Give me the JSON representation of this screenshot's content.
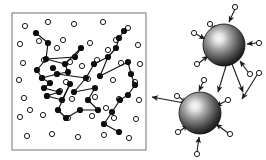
{
  "figure": {
    "background_color": "#ffffff",
    "panels": [
      {
        "id": "left-panel",
        "name": "boxed-particle-network",
        "description": "Square box containing open circles and a connected network of filled circles",
        "box": {
          "x": 12,
          "y": 13,
          "width": 134,
          "height": 137,
          "stroke": "#8a8a8a",
          "stroke_width": 1.2,
          "fill": "#ffffff"
        }
      },
      {
        "id": "right-panel",
        "name": "shaded-spheres-with-arrows",
        "description": "Two shaded spheres surrounded by small open circles and arrows"
      }
    ],
    "colors": {
      "open_circle_stroke": "#1a1a1a",
      "open_circle_fill": "#ffffff",
      "filled_node": "#0d0d0d",
      "edge": "#111111",
      "arrow": "#1a1a1a",
      "sphere_highlight": "#f2f2f2",
      "sphere_mid": "#6e6e6e",
      "sphere_edge": "#121212",
      "box_border": "#8a8a8a"
    }
  },
  "chart_data": {
    "type": "scatter",
    "xlabel": "",
    "ylabel": "",
    "grid": false,
    "legend": false,
    "open_circle_radius": 2.6,
    "filled_node_radius": 3.1,
    "open_circles": [
      [
        25,
        26
      ],
      [
        48,
        22
      ],
      [
        74,
        24
      ],
      [
        103,
        22
      ],
      [
        128,
        28
      ],
      [
        20,
        44
      ],
      [
        39,
        41
      ],
      [
        63,
        40
      ],
      [
        90,
        43
      ],
      [
        116,
        40
      ],
      [
        138,
        45
      ],
      [
        23,
        63
      ],
      [
        44,
        60
      ],
      [
        70,
        62
      ],
      [
        97,
        60
      ],
      [
        121,
        63
      ],
      [
        140,
        64
      ],
      [
        19,
        80
      ],
      [
        42,
        78
      ],
      [
        66,
        82
      ],
      [
        88,
        79
      ],
      [
        113,
        80
      ],
      [
        135,
        82
      ],
      [
        24,
        98
      ],
      [
        47,
        96
      ],
      [
        72,
        99
      ],
      [
        95,
        97
      ],
      [
        119,
        99
      ],
      [
        139,
        100
      ],
      [
        20,
        117
      ],
      [
        43,
        115
      ],
      [
        68,
        118
      ],
      [
        92,
        116
      ],
      [
        114,
        118
      ],
      [
        136,
        119
      ],
      [
        27,
        136
      ],
      [
        52,
        134
      ],
      [
        78,
        137
      ],
      [
        104,
        135
      ],
      [
        129,
        138
      ],
      [
        57,
        48
      ],
      [
        82,
        66
      ],
      [
        108,
        50
      ],
      [
        60,
        91
      ],
      [
        30,
        110
      ],
      [
        106,
        108
      ]
    ],
    "filled_nodes": [
      [
        36,
        33
      ],
      [
        48,
        43
      ],
      [
        46,
        59
      ],
      [
        53,
        68
      ],
      [
        65,
        64
      ],
      [
        68,
        72
      ],
      [
        81,
        48
      ],
      [
        75,
        57
      ],
      [
        37,
        70
      ],
      [
        42,
        78
      ],
      [
        50,
        83
      ],
      [
        57,
        74
      ],
      [
        70,
        84
      ],
      [
        59,
        92
      ],
      [
        47,
        96
      ],
      [
        62,
        100
      ],
      [
        44,
        88
      ],
      [
        58,
        110
      ],
      [
        66,
        118
      ],
      [
        80,
        110
      ],
      [
        88,
        100
      ],
      [
        95,
        88
      ],
      [
        100,
        76
      ],
      [
        94,
        64
      ],
      [
        108,
        57
      ],
      [
        116,
        48
      ],
      [
        119,
        38
      ],
      [
        124,
        31
      ],
      [
        128,
        62
      ],
      [
        131,
        74
      ],
      [
        135,
        85
      ],
      [
        128,
        95
      ],
      [
        120,
        100
      ],
      [
        112,
        112
      ],
      [
        104,
        124
      ],
      [
        119,
        132
      ],
      [
        86,
        78
      ],
      [
        74,
        92
      ],
      [
        98,
        110
      ]
    ],
    "edges": [
      [
        [
          36,
          33
        ],
        [
          48,
          43
        ]
      ],
      [
        [
          48,
          43
        ],
        [
          46,
          59
        ]
      ],
      [
        [
          46,
          59
        ],
        [
          65,
          64
        ]
      ],
      [
        [
          65,
          64
        ],
        [
          81,
          48
        ]
      ],
      [
        [
          81,
          48
        ],
        [
          75,
          57
        ]
      ],
      [
        [
          75,
          57
        ],
        [
          46,
          59
        ]
      ],
      [
        [
          46,
          59
        ],
        [
          37,
          70
        ]
      ],
      [
        [
          37,
          70
        ],
        [
          42,
          78
        ]
      ],
      [
        [
          42,
          78
        ],
        [
          57,
          74
        ]
      ],
      [
        [
          57,
          74
        ],
        [
          86,
          78
        ]
      ],
      [
        [
          86,
          78
        ],
        [
          94,
          64
        ]
      ],
      [
        [
          94,
          64
        ],
        [
          108,
          57
        ]
      ],
      [
        [
          108,
          57
        ],
        [
          116,
          48
        ]
      ],
      [
        [
          116,
          48
        ],
        [
          119,
          38
        ]
      ],
      [
        [
          119,
          38
        ],
        [
          124,
          31
        ]
      ],
      [
        [
          108,
          57
        ],
        [
          100,
          76
        ]
      ],
      [
        [
          100,
          76
        ],
        [
          128,
          62
        ]
      ],
      [
        [
          128,
          62
        ],
        [
          131,
          74
        ]
      ],
      [
        [
          131,
          74
        ],
        [
          135,
          85
        ]
      ],
      [
        [
          135,
          85
        ],
        [
          128,
          95
        ]
      ],
      [
        [
          128,
          95
        ],
        [
          120,
          100
        ]
      ],
      [
        [
          120,
          100
        ],
        [
          112,
          112
        ]
      ],
      [
        [
          112,
          112
        ],
        [
          104,
          124
        ]
      ],
      [
        [
          104,
          124
        ],
        [
          119,
          132
        ]
      ],
      [
        [
          42,
          78
        ],
        [
          50,
          83
        ]
      ],
      [
        [
          50,
          83
        ],
        [
          44,
          88
        ]
      ],
      [
        [
          44,
          88
        ],
        [
          59,
          92
        ]
      ],
      [
        [
          59,
          92
        ],
        [
          47,
          96
        ]
      ],
      [
        [
          47,
          96
        ],
        [
          62,
          100
        ]
      ],
      [
        [
          62,
          100
        ],
        [
          70,
          84
        ]
      ],
      [
        [
          70,
          84
        ],
        [
          58,
          110
        ]
      ],
      [
        [
          58,
          110
        ],
        [
          66,
          118
        ]
      ],
      [
        [
          66,
          118
        ],
        [
          80,
          110
        ]
      ],
      [
        [
          80,
          110
        ],
        [
          98,
          110
        ]
      ],
      [
        [
          98,
          110
        ],
        [
          88,
          100
        ]
      ],
      [
        [
          88,
          100
        ],
        [
          95,
          88
        ]
      ],
      [
        [
          95,
          88
        ],
        [
          74,
          92
        ]
      ],
      [
        [
          74,
          92
        ],
        [
          86,
          78
        ]
      ],
      [
        [
          68,
          72
        ],
        [
          65,
          64
        ]
      ],
      [
        [
          68,
          72
        ],
        [
          57,
          74
        ]
      ]
    ],
    "spheres": [
      {
        "name": "upper-sphere",
        "cx": 224,
        "cy": 45,
        "r": 21
      },
      {
        "name": "lower-sphere",
        "cx": 200,
        "cy": 113,
        "r": 21
      }
    ],
    "arrows": [
      {
        "sphere": "upper-sphere",
        "direction": "inbound",
        "tail": [
          235,
          9
        ],
        "head": [
          229,
          22
        ],
        "tail_circle": [
          235,
          7
        ]
      },
      {
        "sphere": "upper-sphere",
        "direction": "inbound",
        "tail": [
          212,
          25
        ],
        "head": [
          216,
          31
        ],
        "tail_circle": [
          210,
          24
        ]
      },
      {
        "sphere": "upper-sphere",
        "direction": "inbound",
        "tail": [
          196,
          34
        ],
        "head": [
          205,
          39
        ],
        "tail_circle": [
          194,
          33
        ]
      },
      {
        "sphere": "upper-sphere",
        "direction": "inbound",
        "tail": [
          257,
          43
        ],
        "head": [
          247,
          44
        ],
        "tail_circle": [
          259,
          43
        ]
      },
      {
        "sphere": "upper-sphere",
        "direction": "inbound",
        "tail": [
          199,
          63
        ],
        "head": [
          208,
          56
        ],
        "tail_circle": [
          197,
          64
        ]
      },
      {
        "sphere": "upper-sphere",
        "direction": "inbound",
        "tail": [
          248,
          72
        ],
        "head": [
          240,
          61
        ],
        "tail_circle": [
          250,
          74
        ]
      },
      {
        "sphere": "upper-sphere",
        "direction": "outbound",
        "tail": [
          232,
          64
        ],
        "head": [
          243,
          92
        ],
        "tail_circle": null
      },
      {
        "sphere": "upper-sphere",
        "direction": "outbound",
        "tail": [
          226,
          66
        ],
        "head": [
          218,
          92
        ],
        "tail_circle": null
      },
      {
        "sphere": "lower-sphere",
        "direction": "outbound",
        "tail": [
          184,
          103
        ],
        "head": [
          152,
          97
        ],
        "tail_circle": null
      },
      {
        "sphere": "lower-sphere",
        "direction": "inbound",
        "tail": [
          179,
          97
        ],
        "head": [
          187,
          103
        ],
        "tail_circle": [
          177,
          96
        ]
      },
      {
        "sphere": "lower-sphere",
        "direction": "inbound",
        "tail": [
          203,
          82
        ],
        "head": [
          199,
          91
        ],
        "tail_circle": [
          204,
          80
        ]
      },
      {
        "sphere": "lower-sphere",
        "direction": "inbound",
        "tail": [
          226,
          101
        ],
        "head": [
          216,
          106
        ],
        "tail_circle": [
          228,
          100
        ]
      },
      {
        "sphere": "lower-sphere",
        "direction": "inbound",
        "tail": [
          180,
          131
        ],
        "head": [
          188,
          125
        ],
        "tail_circle": [
          178,
          132
        ]
      },
      {
        "sphere": "lower-sphere",
        "direction": "inbound",
        "tail": [
          228,
          133
        ],
        "head": [
          216,
          124
        ],
        "tail_circle": [
          230,
          134
        ]
      },
      {
        "sphere": "lower-sphere",
        "direction": "inbound",
        "tail": [
          197,
          152
        ],
        "head": [
          199,
          137
        ],
        "tail_circle": [
          197,
          154
        ]
      },
      {
        "sphere": "lower-sphere",
        "direction": "inbound",
        "tail": [
          257,
          75
        ],
        "head": [
          242,
          99
        ],
        "tail_circle": [
          259,
          73
        ]
      }
    ]
  }
}
